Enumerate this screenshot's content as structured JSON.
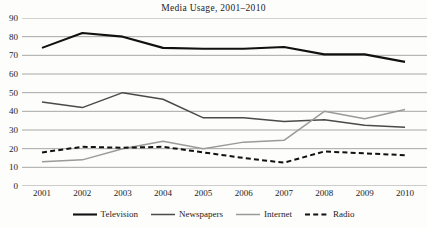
{
  "chart_data": {
    "type": "line",
    "title": "Media  Usage, 2001–2010",
    "xlabel": "",
    "ylabel": "",
    "categories": [
      "2001",
      "2002",
      "2003",
      "2004",
      "2005",
      "2006",
      "2007",
      "2008",
      "2009",
      "2010"
    ],
    "x": [
      2001,
      2002,
      2003,
      2004,
      2005,
      2006,
      2007,
      2008,
      2009,
      2010
    ],
    "ylim": [
      0,
      90
    ],
    "ytick_labels": [
      "90",
      "80",
      "70",
      "60",
      "50",
      "40",
      "30",
      "20",
      "10",
      "0"
    ],
    "ytick_values": [
      90,
      80,
      70,
      60,
      50,
      40,
      30,
      20,
      10,
      0
    ],
    "grid": true,
    "legend_position": "bottom",
    "series": [
      {
        "name": "Television",
        "color": "#111111",
        "width": 2.1,
        "dash": "none",
        "values": [
          74,
          82,
          80,
          74,
          73.5,
          73.5,
          74.5,
          70.5,
          70.5,
          66.5
        ]
      },
      {
        "name": "Newspapers",
        "color": "#4a4a4a",
        "width": 1.5,
        "dash": "none",
        "values": [
          45,
          42,
          50,
          46.5,
          36.5,
          36.5,
          34.5,
          35.5,
          32.5,
          31.5
        ]
      },
      {
        "name": "Internet",
        "color": "#9a9a9a",
        "width": 1.5,
        "dash": "none",
        "values": [
          13,
          14,
          20,
          24,
          20,
          23.5,
          24.5,
          40,
          36,
          41
        ]
      },
      {
        "name": "Radio",
        "color": "#111111",
        "width": 2.0,
        "dash": "dashed",
        "values": [
          18,
          21,
          20.5,
          21,
          18,
          15,
          12.5,
          18.5,
          17.5,
          16.5
        ]
      }
    ]
  },
  "axis": {
    "grid_color": "#9d9d9d"
  }
}
